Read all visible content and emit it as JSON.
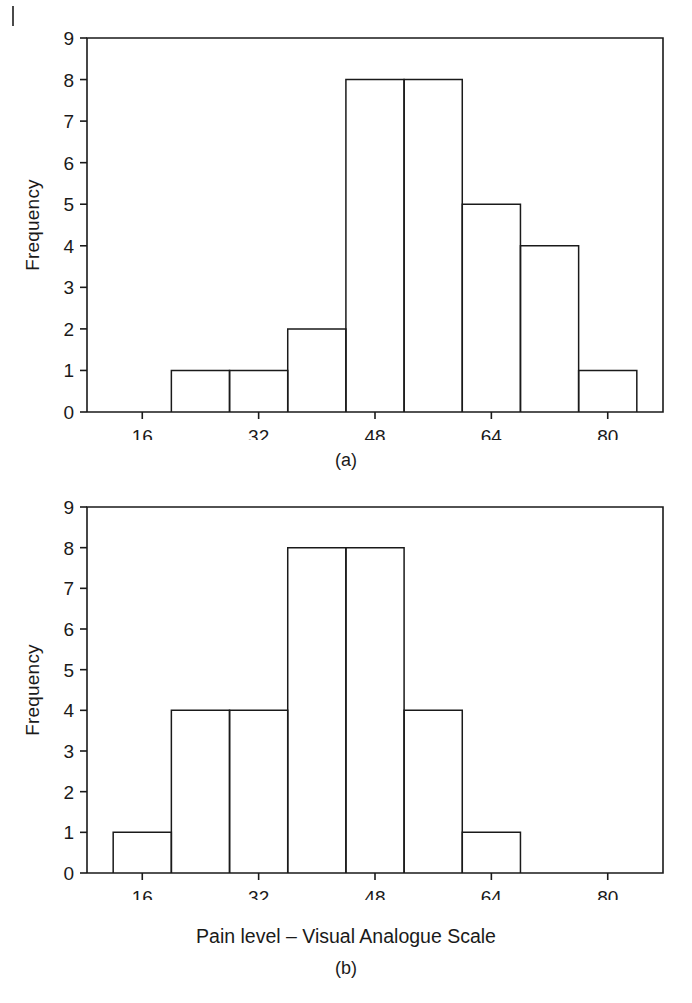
{
  "page": {
    "background_color": "#ffffff",
    "ink_color": "#1a1a1a",
    "corner_mark": "page-edge-bleed-mark"
  },
  "figure_a": {
    "panel_label": "(a)",
    "y_axis_title": "Frequency",
    "y_ticks": [
      "0",
      "1",
      "2",
      "3",
      "4",
      "5",
      "6",
      "7",
      "8",
      "9"
    ],
    "x_ticks": [
      "16",
      "32",
      "48",
      "64",
      "80"
    ]
  },
  "figure_b": {
    "panel_label": "(b)",
    "y_axis_title": "Frequency",
    "x_axis_title": "Pain level – Visual Analogue Scale",
    "y_ticks": [
      "0",
      "1",
      "2",
      "3",
      "4",
      "5",
      "6",
      "7",
      "8",
      "9"
    ],
    "x_ticks": [
      "16",
      "32",
      "48",
      "64",
      "80"
    ]
  },
  "chart_data": [
    {
      "id": "histogram-a",
      "type": "bar",
      "title": "(a)",
      "xlabel": "Pain level – Visual Analogue Scale",
      "ylabel": "Frequency",
      "ylim": [
        0,
        9
      ],
      "xlim": [
        8.4,
        87.6
      ],
      "grid": false,
      "legend": false,
      "x_tick_values": [
        16,
        32,
        48,
        64,
        80
      ],
      "y_tick_values": [
        0,
        1,
        2,
        3,
        4,
        5,
        6,
        7,
        8,
        9
      ],
      "bin_width": 8,
      "bin_edges": [
        20,
        28,
        36,
        44,
        52,
        60,
        68,
        76
      ],
      "bins": [
        {
          "left": 20,
          "right": 28,
          "count": 1
        },
        {
          "left": 28,
          "right": 36,
          "count": 1
        },
        {
          "left": 36,
          "right": 44,
          "count": 2
        },
        {
          "left": 44,
          "right": 52,
          "count": 8
        },
        {
          "left": 52,
          "right": 60,
          "count": 8
        },
        {
          "left": 60,
          "right": 68,
          "count": 5
        },
        {
          "left": 68,
          "right": 76,
          "count": 4
        },
        {
          "left": 76,
          "right": 84,
          "count": 1
        }
      ],
      "values": [
        1,
        1,
        2,
        8,
        8,
        5,
        4,
        1
      ],
      "categories": [
        "20-28",
        "28-36",
        "36-44",
        "44-52",
        "52-60",
        "60-68",
        "68-76",
        "76-84"
      ],
      "total": 30
    },
    {
      "id": "histogram-b",
      "type": "bar",
      "title": "(b)",
      "xlabel": "Pain level – Visual Analogue Scale",
      "ylabel": "Frequency",
      "ylim": [
        0,
        9
      ],
      "xlim": [
        8.4,
        87.6
      ],
      "grid": false,
      "legend": false,
      "x_tick_values": [
        16,
        32,
        48,
        64,
        80
      ],
      "y_tick_values": [
        0,
        1,
        2,
        3,
        4,
        5,
        6,
        7,
        8,
        9
      ],
      "bin_width": 8,
      "bin_edges": [
        12,
        20,
        28,
        36,
        44,
        52,
        60,
        68
      ],
      "bins": [
        {
          "left": 12,
          "right": 20,
          "count": 1
        },
        {
          "left": 20,
          "right": 28,
          "count": 4
        },
        {
          "left": 28,
          "right": 36,
          "count": 4
        },
        {
          "left": 36,
          "right": 44,
          "count": 8
        },
        {
          "left": 44,
          "right": 52,
          "count": 8
        },
        {
          "left": 52,
          "right": 60,
          "count": 4
        },
        {
          "left": 60,
          "right": 68,
          "count": 1
        },
        {
          "left": 68,
          "right": 76,
          "count": 0
        }
      ],
      "values": [
        1,
        4,
        4,
        8,
        8,
        4,
        1,
        0
      ],
      "categories": [
        "12-20",
        "20-28",
        "28-36",
        "36-44",
        "44-52",
        "52-60",
        "60-68",
        "68-76"
      ],
      "total": 30
    }
  ]
}
